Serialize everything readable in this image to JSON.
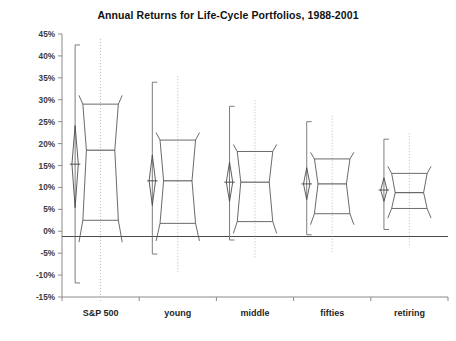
{
  "chart_data": {
    "type": "box",
    "title": "Annual Returns for Life-Cycle Portfolios, 1988-2001",
    "xlabel": "",
    "ylabel": "Annual % Return",
    "ylim": [
      -15,
      45
    ],
    "ytick_step": 5,
    "ytick_labels": [
      "45%",
      "40%",
      "35%",
      "30%",
      "25%",
      "20%",
      "15%",
      "10%",
      "5%",
      "0%",
      "-5%",
      "-10%",
      "-15%"
    ],
    "ytick_values": [
      45,
      40,
      35,
      30,
      25,
      20,
      15,
      10,
      5,
      0,
      -5,
      -10,
      -15
    ],
    "categories": [
      "S&P 500",
      "young",
      "middle",
      "fifties",
      "retiring"
    ],
    "grid": false,
    "legend": "none",
    "grand_mean": -1.2,
    "groups": [
      {
        "name": "S&P 500",
        "range_min": -11.8,
        "range_max": 42.5,
        "box_min": -2.5,
        "q1": 2.5,
        "median": 18.5,
        "q3": 29.0,
        "box_max": 31.0,
        "mean": 15.3,
        "mean_ci_lower": 5.4,
        "mean_ci_upper": 24.1
      },
      {
        "name": "young",
        "range_min": -5.2,
        "range_max": 34.0,
        "box_min": -2.2,
        "q1": 1.8,
        "median": 11.5,
        "q3": 20.8,
        "box_max": 22.5,
        "mean": 11.5,
        "mean_ci_lower": 5.9,
        "mean_ci_upper": 17.4
      },
      {
        "name": "middle",
        "range_min": -2.0,
        "range_max": 28.5,
        "box_min": -0.5,
        "q1": 2.2,
        "median": 11.2,
        "q3": 18.2,
        "box_max": 19.8,
        "mean": 11.2,
        "mean_ci_lower": 6.8,
        "mean_ci_upper": 15.8
      },
      {
        "name": "fifties",
        "range_min": -0.8,
        "range_max": 25.0,
        "box_min": 1.5,
        "q1": 4.0,
        "median": 10.8,
        "q3": 16.5,
        "box_max": 18.0,
        "mean": 10.8,
        "mean_ci_lower": 7.2,
        "mean_ci_upper": 14.5
      },
      {
        "name": "retiring",
        "range_min": 0.4,
        "range_max": 21.0,
        "box_min": 3.0,
        "q1": 5.2,
        "median": 8.8,
        "q3": 13.2,
        "box_max": 14.8,
        "mean": 9.4,
        "mean_ci_lower": 6.8,
        "mean_ci_upper": 12.2
      }
    ]
  },
  "axes": {
    "y_title": "Annual % Return"
  }
}
